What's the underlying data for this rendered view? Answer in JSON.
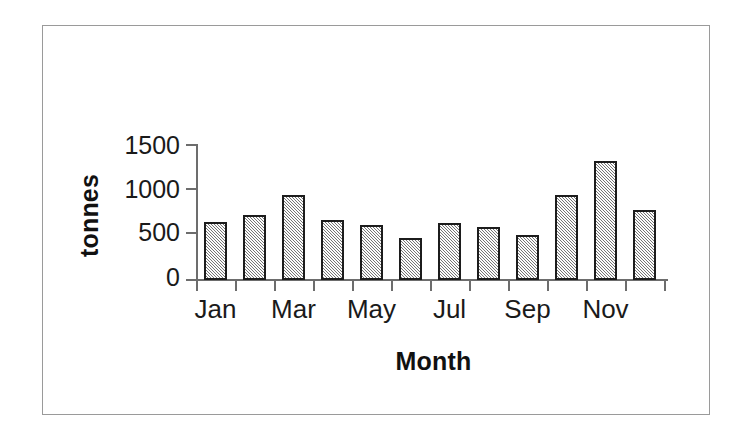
{
  "figure": {
    "background_color": "#ffffff",
    "frame_color": "#9a9a9a",
    "axis_color": "#6d6d6d",
    "bar_fill_color": "#c9c9c9",
    "bar_edge_color": "#1c1c1c",
    "text_color": "#1a1a1a"
  },
  "chart_data": {
    "type": "bar",
    "title": "",
    "xlabel": "Month",
    "ylabel": "tonnes",
    "categories": [
      "Jan",
      "Feb",
      "Mar",
      "Apr",
      "May",
      "Jun",
      "Jul",
      "Aug",
      "Sep",
      "Oct",
      "Nov",
      "Dec"
    ],
    "values": [
      650,
      720,
      950,
      670,
      610,
      470,
      630,
      585,
      495,
      945,
      1320,
      780
    ],
    "xtick_labels": [
      "Jan",
      "Mar",
      "May",
      "Jul",
      "Sep",
      "Nov"
    ],
    "xtick_label_categories": [
      "Jan",
      "Mar",
      "May",
      "Jul",
      "Sep",
      "Nov"
    ],
    "ytick_labels": [
      "1500",
      "1000",
      "500",
      "0"
    ],
    "ytick_values": [
      1500,
      1000,
      500,
      0
    ],
    "ylim": [
      0,
      1500
    ],
    "grid": false,
    "legend": false,
    "legend_position": "none",
    "series": [
      {
        "name": "tonnes",
        "values": [
          650,
          720,
          950,
          670,
          610,
          470,
          630,
          585,
          495,
          945,
          1320,
          780
        ]
      }
    ]
  }
}
